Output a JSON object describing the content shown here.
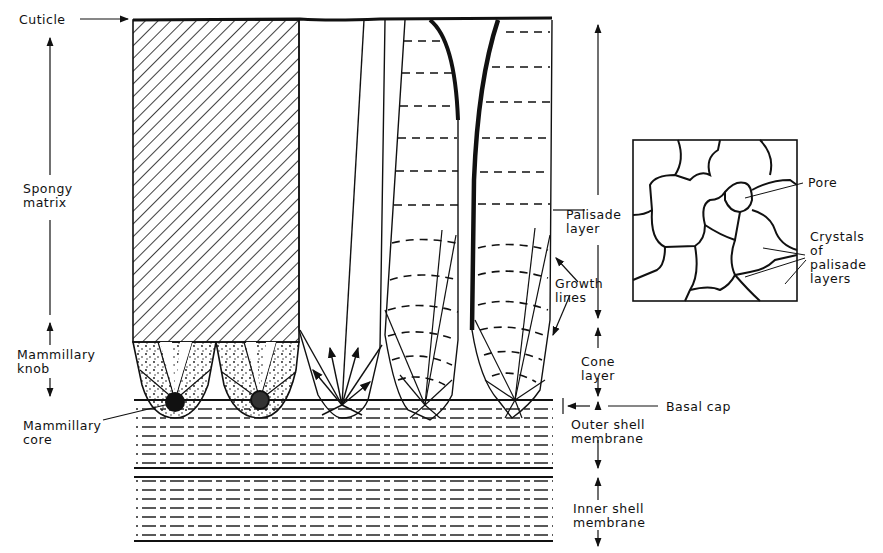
{
  "diagram": {
    "labels": {
      "cuticle": "Cuticle",
      "spongy_matrix": "Spongy\nmatrix",
      "mammillary_knob": "Mammillary\nknob",
      "mammillary_core": "Mammillary\ncore",
      "palisade_layer": "Palisade\nlayer",
      "growth_lines": "Growth\nlines",
      "cone_layer": "Cone\nlayer",
      "basal_cap": "Basal cap",
      "outer_shell_membrane": "Outer shell\nmembrane",
      "inner_shell_membrane": "Inner shell\nmembrane",
      "pore": "Pore",
      "crystals_of_palisade_layers": "Crystals\nof\npalisade\nlayers"
    },
    "colors": {
      "ink": "#111111",
      "background": "#ffffff"
    }
  }
}
